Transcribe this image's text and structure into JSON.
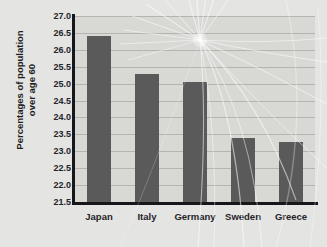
{
  "chart_data": {
    "type": "bar",
    "title": "",
    "subtitle": "",
    "xlabel": "",
    "ylabel": "Percentages of population over age 60",
    "ylabel_lines": [
      "Percentages of population",
      "over age 60"
    ],
    "categories": [
      "Japan",
      "Italy",
      "Germany",
      "Sweden",
      "Greece"
    ],
    "values": [
      26.4,
      25.3,
      25.05,
      23.38,
      23.27
    ],
    "ylim": [
      21.5,
      27.0
    ],
    "yticks": [
      21.5,
      22.0,
      22.5,
      23.0,
      23.5,
      24.0,
      24.5,
      25.0,
      25.5,
      26.0,
      26.5,
      27.0
    ],
    "ytick_labels": [
      "21.5",
      "22.0",
      "22.5",
      "23.0",
      "23.5",
      "24.0",
      "24.5",
      "25.0",
      "25.5",
      "26.0",
      "26.5",
      "27.0"
    ],
    "grid": true,
    "grid_axis": "y",
    "legend": false,
    "legend_position": "none",
    "series": [
      {
        "name": "Percentage over age 60",
        "values": [
          26.4,
          25.3,
          25.05,
          23.38,
          23.27
        ]
      }
    ],
    "colors": {
      "bar": "#595a59",
      "plot_background": "#d8d9d5",
      "figure_background": "#e4e4e2",
      "gridline": "#b4b5b1",
      "axis": "#17171a",
      "text": "#24242a",
      "ray_overlay": "#ffffff"
    }
  }
}
